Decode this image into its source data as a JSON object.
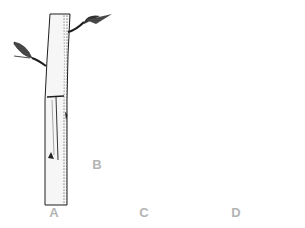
{
  "figure": {
    "panels": [
      {
        "id": "A",
        "label": "A"
      },
      {
        "id": "B",
        "label": "B"
      },
      {
        "id": "C",
        "label": "C"
      },
      {
        "id": "D",
        "label": "D"
      }
    ],
    "colors": {
      "ink": "#1e1e1e",
      "bark": "#f4f4f4",
      "wrap": "#4a4a4a",
      "label": "#b4b4b4"
    }
  }
}
